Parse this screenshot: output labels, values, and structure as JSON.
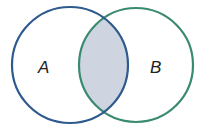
{
  "diagram": {
    "type": "venn",
    "sets": [
      {
        "label": "A",
        "cx": 70,
        "cy": 65,
        "r": 58,
        "stroke": "#2e5a8e"
      },
      {
        "label": "B",
        "cx": 136,
        "cy": 65,
        "r": 57,
        "stroke": "#3a8a72"
      }
    ],
    "highlighted_region": "A ∩ B",
    "highlight_fill": "#cfd5e0"
  }
}
